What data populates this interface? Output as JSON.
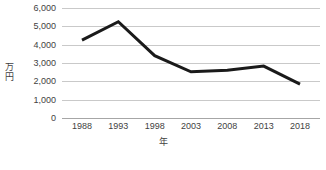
{
  "chart_data": {
    "type": "line",
    "title": "",
    "xlabel": "年",
    "ylabel": "万円",
    "categories": [
      "1988",
      "1993",
      "1998",
      "2003",
      "2008",
      "2013",
      "2018"
    ],
    "values": [
      4250,
      5250,
      3400,
      2520,
      2600,
      2830,
      1850
    ],
    "series": [
      {
        "name": "",
        "values": [
          4250,
          5250,
          3400,
          2520,
          2600,
          2830,
          1850
        ]
      }
    ],
    "ylim": [
      0,
      6000
    ],
    "ytick_values": [
      0,
      1000,
      2000,
      3000,
      4000,
      5000,
      6000
    ],
    "ytick_labels": [
      "0",
      "1,000",
      "2,000",
      "3,000",
      "4,000",
      "5,000",
      "6,000"
    ],
    "xtick_labels": [
      "1988",
      "1993",
      "1998",
      "2003",
      "2008",
      "2013",
      "2018"
    ],
    "grid": true,
    "legend": false,
    "legend_position": "none",
    "line_color": "#1a1a1a",
    "gridline_color": "#c9c9c9",
    "axis_color": "#a6a6a6",
    "text_color": "#3f3f3f",
    "background_color": "#ffffff"
  }
}
